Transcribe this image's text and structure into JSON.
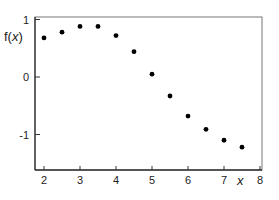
{
  "chart_data": {
    "type": "scatter",
    "title": "",
    "xlabel": "x",
    "ylabel": "f(x)",
    "xlim": [
      1.75,
      8.05
    ],
    "ylim": [
      -1.6,
      1.05
    ],
    "xticks": [
      2,
      3,
      4,
      5,
      6,
      7,
      8
    ],
    "yticks": [
      1,
      0,
      -1
    ],
    "grid": false,
    "legend": null,
    "series": [
      {
        "name": "f(x)",
        "x": [
          2,
          2.5,
          3,
          3.5,
          4,
          4.5,
          5,
          5.5,
          6,
          6.5,
          7,
          7.5
        ],
        "y": [
          0.68,
          0.78,
          0.88,
          0.88,
          0.72,
          0.44,
          0.05,
          -0.33,
          -0.68,
          -0.91,
          -1.1,
          -1.22
        ]
      }
    ]
  },
  "labels": {
    "ylabel_prefix": "f(",
    "ylabel_var": "x",
    "ylabel_suffix": ")",
    "xlabel": "x",
    "xtick_labels": [
      "2",
      "3",
      "4",
      "5",
      "6",
      "7",
      "8"
    ],
    "ytick_labels": [
      "1",
      "0",
      "-1"
    ]
  }
}
